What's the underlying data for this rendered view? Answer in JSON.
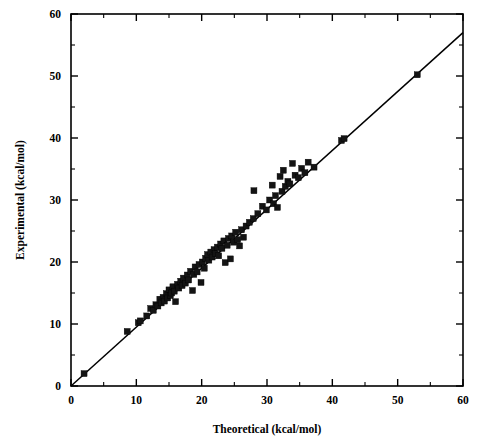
{
  "chart_data": {
    "type": "scatter",
    "title": "",
    "xlabel": "Theoretical (kcal/mol)",
    "ylabel": "Experimental (kcal/mol)",
    "xlim": [
      0,
      60
    ],
    "ylim": [
      0,
      60
    ],
    "xticks": [
      0,
      10,
      20,
      30,
      40,
      50,
      60
    ],
    "yticks": [
      0,
      10,
      20,
      30,
      40,
      50,
      60
    ],
    "xticklabels": [
      "0",
      "10",
      "20",
      "30",
      "40",
      "50",
      "60"
    ],
    "yticklabels": [
      "0",
      "10",
      "20",
      "30",
      "40",
      "50",
      "60"
    ],
    "minor_tick_interval": 5,
    "grid": false,
    "legend": null,
    "marker_style": "filled-square",
    "marker_color": "#141414",
    "line": {
      "name": "identity / regression line",
      "x": [
        0,
        60
      ],
      "y": [
        0,
        57
      ],
      "color": "#000000"
    },
    "series": [
      {
        "name": "Experimental vs Theoretical",
        "points": [
          [
            2.0,
            2.0
          ],
          [
            8.6,
            8.8
          ],
          [
            10.3,
            10.2
          ],
          [
            10.6,
            10.5
          ],
          [
            11.6,
            11.3
          ],
          [
            12.2,
            12.5
          ],
          [
            12.6,
            12.2
          ],
          [
            13.0,
            13.1
          ],
          [
            13.3,
            12.9
          ],
          [
            13.6,
            14.0
          ],
          [
            13.8,
            13.4
          ],
          [
            14.1,
            14.3
          ],
          [
            14.3,
            13.7
          ],
          [
            14.6,
            14.9
          ],
          [
            14.8,
            14.2
          ],
          [
            15.0,
            15.5
          ],
          [
            15.2,
            14.6
          ],
          [
            15.4,
            15.0
          ],
          [
            15.6,
            16.0
          ],
          [
            15.8,
            15.3
          ],
          [
            16.0,
            13.6
          ],
          [
            16.3,
            16.4
          ],
          [
            16.5,
            15.8
          ],
          [
            16.8,
            16.9
          ],
          [
            17.0,
            16.2
          ],
          [
            17.2,
            17.4
          ],
          [
            17.5,
            16.6
          ],
          [
            17.8,
            17.9
          ],
          [
            18.0,
            17.1
          ],
          [
            18.3,
            18.5
          ],
          [
            18.6,
            15.4
          ],
          [
            18.8,
            18.0
          ],
          [
            19.0,
            19.2
          ],
          [
            19.3,
            18.4
          ],
          [
            19.6,
            19.6
          ],
          [
            19.9,
            16.7
          ],
          [
            20.1,
            20.0
          ],
          [
            20.4,
            19.0
          ],
          [
            20.6,
            20.6
          ],
          [
            20.9,
            21.2
          ],
          [
            21.1,
            20.3
          ],
          [
            21.4,
            21.6
          ],
          [
            21.6,
            20.8
          ],
          [
            21.9,
            22.0
          ],
          [
            22.1,
            21.4
          ],
          [
            22.4,
            22.4
          ],
          [
            22.6,
            21.0
          ],
          [
            22.9,
            22.9
          ],
          [
            23.1,
            22.2
          ],
          [
            23.4,
            23.4
          ],
          [
            23.6,
            19.9
          ],
          [
            23.9,
            22.7
          ],
          [
            24.1,
            23.8
          ],
          [
            24.4,
            20.5
          ],
          [
            24.6,
            24.2
          ],
          [
            24.9,
            23.2
          ],
          [
            25.2,
            24.8
          ],
          [
            25.5,
            23.6
          ],
          [
            25.8,
            22.6
          ],
          [
            26.1,
            25.2
          ],
          [
            26.4,
            24.0
          ],
          [
            26.8,
            25.8
          ],
          [
            27.3,
            26.4
          ],
          [
            27.9,
            27.0
          ],
          [
            28.0,
            31.5
          ],
          [
            28.6,
            27.8
          ],
          [
            29.3,
            29.0
          ],
          [
            29.9,
            28.4
          ],
          [
            30.4,
            30.0
          ],
          [
            30.8,
            32.4
          ],
          [
            31.0,
            29.4
          ],
          [
            31.3,
            30.7
          ],
          [
            31.6,
            28.8
          ],
          [
            32.0,
            33.8
          ],
          [
            32.3,
            31.4
          ],
          [
            32.5,
            34.8
          ],
          [
            32.8,
            32.2
          ],
          [
            33.2,
            33.0
          ],
          [
            33.5,
            32.6
          ],
          [
            33.9,
            35.9
          ],
          [
            34.3,
            34.0
          ],
          [
            34.8,
            33.6
          ],
          [
            35.3,
            35.1
          ],
          [
            35.8,
            34.4
          ],
          [
            36.3,
            36.1
          ],
          [
            37.2,
            35.3
          ],
          [
            41.4,
            39.6
          ],
          [
            41.8,
            39.9
          ],
          [
            53.0,
            50.2
          ]
        ]
      }
    ]
  }
}
